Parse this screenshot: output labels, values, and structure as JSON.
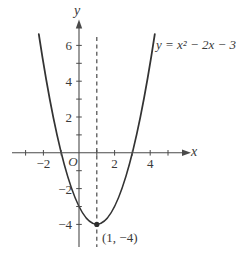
{
  "figure": {
    "background": "#ffffff",
    "ink_color": "#333333",
    "axis_color": "#4a4a4a",
    "text_color": "#3a3a3a",
    "labels": {
      "equation": "y = x² − 2x − 3",
      "vertex_point": "(1, −4)",
      "origin": "O",
      "x_axis": "x",
      "y_axis": "y"
    }
  },
  "chart_data": {
    "type": "line",
    "title": "",
    "equation_annotation": "y = x² − 2x − 3",
    "function": {
      "formula": "y = x^2 - 2x - 3",
      "a": 1,
      "b": -2,
      "c": -3
    },
    "vertex": {
      "x": 1,
      "y": -4,
      "label": "(1, −4)"
    },
    "x_intercepts": [
      -1,
      3
    ],
    "y_intercept": -3,
    "axis_of_symmetry_x": 1,
    "axis_of_symmetry_style": "dashed",
    "curve_x_range": [
      -2.26,
      4.26
    ],
    "points": [
      {
        "x": -2,
        "y": 5
      },
      {
        "x": -1,
        "y": 0
      },
      {
        "x": 0,
        "y": -3
      },
      {
        "x": 1,
        "y": -4
      },
      {
        "x": 2,
        "y": -3
      },
      {
        "x": 3,
        "y": 0
      },
      {
        "x": 4,
        "y": 5
      }
    ],
    "x_axis": {
      "label": "x",
      "ticks": [
        -3,
        -2,
        -1,
        1,
        2,
        3,
        4,
        5
      ],
      "labeled_ticks": [
        {
          "value": -2,
          "text": "−2"
        },
        {
          "value": 2,
          "text": "2"
        },
        {
          "value": 4,
          "text": "4"
        }
      ],
      "xlim": [
        -3.8,
        6.2
      ]
    },
    "y_axis": {
      "label": "y",
      "ticks": [
        -4,
        -3,
        -2,
        -1,
        1,
        2,
        3,
        4,
        5,
        6
      ],
      "labeled_ticks": [
        {
          "value": 6,
          "text": "6"
        },
        {
          "value": 4,
          "text": "4"
        },
        {
          "value": 2,
          "text": "2"
        },
        {
          "value": -2,
          "text": "−2"
        },
        {
          "value": -4,
          "text": "−4"
        }
      ],
      "ylim": [
        -5.8,
        7.4
      ]
    },
    "origin_label": "O",
    "grid": false,
    "legend": false
  }
}
